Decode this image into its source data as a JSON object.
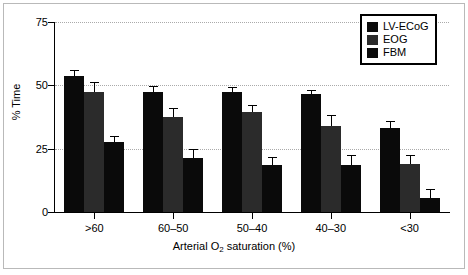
{
  "chart_data": {
    "type": "bar",
    "title": "",
    "xlabel": "Arterial O2 saturation (%)",
    "xlabel_parts": {
      "pre": "Arterial O",
      "sub": "2",
      "post": " saturation (%)"
    },
    "ylabel": "% Time",
    "ylim": [
      0,
      75
    ],
    "yticks": [
      0,
      25,
      50,
      75
    ],
    "ytick_labels": [
      "0",
      "25",
      "50",
      "75"
    ],
    "grid": "horizontal-dotted",
    "legend_position": "top-right",
    "categories": [
      ">60",
      "60–50",
      "50–40",
      "40–30",
      "<30"
    ],
    "series": [
      {
        "name": "LV-ECoG",
        "color": "#0a0a0a",
        "values": [
          53.5,
          47.5,
          47.5,
          46.5,
          33.0
        ],
        "errors": [
          2.0,
          1.8,
          1.5,
          1.3,
          2.5
        ]
      },
      {
        "name": "EOG",
        "color": "#2b2b2b",
        "values": [
          47.5,
          37.5,
          39.5,
          34.0,
          19.0
        ],
        "errors": [
          3.5,
          3.0,
          2.5,
          4.0,
          3.0
        ]
      },
      {
        "name": "FBM",
        "color": "#0a0a0a",
        "values": [
          27.5,
          21.5,
          18.5,
          18.5,
          5.5
        ]
      }
    ],
    "fbm_errors": [
      2.0,
      3.0,
      3.0,
      3.5,
      3.0
    ]
  },
  "legend": {
    "items": [
      {
        "label": "LV-ECoG",
        "color": "#0a0a0a"
      },
      {
        "label": "EOG",
        "color": "#2b2b2b"
      },
      {
        "label": "FBM",
        "color": "#0a0a0a"
      }
    ]
  }
}
